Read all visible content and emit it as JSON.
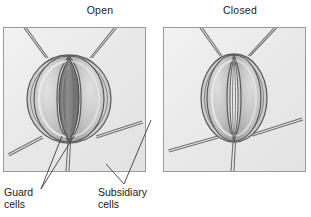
{
  "figure": {
    "topic": "stomata-guard-cell-diagram",
    "panels": [
      {
        "id": "open",
        "title": "Open",
        "state": "open",
        "pore_visible": true,
        "description": "Stoma with turgid guard cells and a wide open stomatal pore surrounded by subsidiary cells"
      },
      {
        "id": "closed",
        "title": "Closed",
        "state": "closed",
        "pore_visible": false,
        "description": "Stoma with flaccid guard cells pressed together so the stomatal pore is closed"
      }
    ],
    "labels": [
      {
        "id": "guard-cells",
        "text": "Guard\ncells",
        "line1": "Guard",
        "line2": "cells",
        "leaders": 2
      },
      {
        "id": "subsidiary-cells",
        "text": "Subsidiary\ncells",
        "line1": "Subsidiary",
        "line2": "cells",
        "leaders": 2
      }
    ],
    "colors": {
      "background": "#ffffff",
      "panel_fill": "#ececec",
      "panel_border": "#9a9a9a",
      "cell_wall_line": "#6f6f6f",
      "guard_cell_fill": "#c6c6c6",
      "guard_cell_highlight": "#dcdcdc",
      "pore_fill": "#7d7d7d",
      "text": "#1a1a1a",
      "leader_line": "#3d3d3d"
    }
  }
}
